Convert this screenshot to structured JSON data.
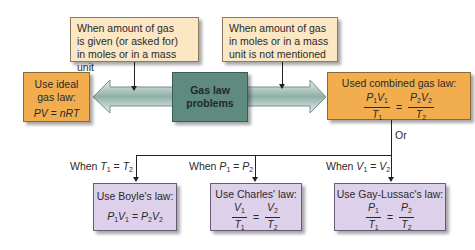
{
  "top_boxes": {
    "left": {
      "lines": [
        "When amount of gas",
        "is given (or asked for)",
        "in moles or in a mass unit"
      ]
    },
    "right": {
      "lines": [
        "When amount of gas",
        "in moles or in a mass",
        "unit is not mentioned"
      ]
    }
  },
  "center": {
    "lines": [
      "Gas law",
      "problems"
    ]
  },
  "ideal": {
    "title_lines": [
      "Use ideal",
      "gas law:"
    ],
    "formula": "PV = nRT"
  },
  "combined": {
    "title": "Used combined gas law:",
    "n1": "P",
    "n1s": "1",
    "n2": "V",
    "n2s": "1",
    "d1": "T",
    "d1s": "1",
    "m1": "P",
    "m1s": "2",
    "m2": "V",
    "m2s": "2",
    "e1": "T",
    "e1s": "2",
    "eq": "="
  },
  "or_label": "Or",
  "conditions": [
    {
      "prefix": "When ",
      "a": "T",
      "as": "1",
      "op": " = ",
      "b": "T",
      "bs": "2"
    },
    {
      "prefix": "When ",
      "a": "P",
      "as": "1",
      "op": " = ",
      "b": "P",
      "bs": "2"
    },
    {
      "prefix": "When ",
      "a": "V",
      "as": "1",
      "op": " = ",
      "b": "V",
      "bs": "2"
    }
  ],
  "laws": [
    {
      "title": "Use Boyle's law:",
      "formula": {
        "a": "P",
        "as": "1",
        "b": "V",
        "bs": "1",
        "eq": " = ",
        "c": "P",
        "cs": "2",
        "d": "V",
        "ds": "2"
      }
    },
    {
      "title": "Use Charles' law:",
      "formula": {
        "n1": "V",
        "n1s": "1",
        "d1": "T",
        "d1s": "1",
        "eq": "=",
        "n2": "V",
        "n2s": "2",
        "d2": "T",
        "d2s": "2"
      }
    },
    {
      "title": "Use Gay-Lussac's law:",
      "formula": {
        "n1": "P",
        "n1s": "1",
        "d1": "T",
        "d1s": "1",
        "eq": "=",
        "n2": "P",
        "n2s": "2",
        "d2": "T",
        "d2s": "2"
      }
    }
  ],
  "colors": {
    "cream": "#fbe7c4",
    "orange": "#f2ad4e",
    "teal": "#5f8a7f",
    "lavender": "#ddd0ea"
  }
}
